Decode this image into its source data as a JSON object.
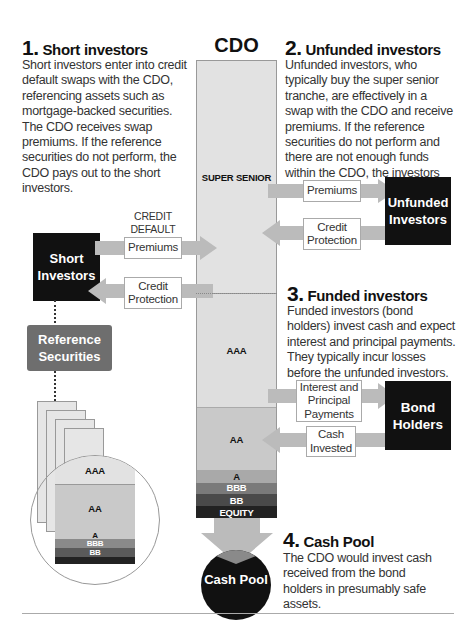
{
  "sections": {
    "short": {
      "number": "1.",
      "title": "Short investors",
      "body": "Short investors enter into credit default swaps with the CDO, referencing assets such as mortgage-backed securities. The CDO receives swap premiums. If the reference securities do not perform, the CDO pays out to the short investors."
    },
    "unfunded": {
      "number": "2.",
      "title": "Unfunded investors",
      "body": "Unfunded investors, who typically buy the super senior tranche, are effectively in a swap with the CDO and receive premiums. If the reference securities do not perform and there are not enough funds within the CDO, the investors pay."
    },
    "funded": {
      "number": "3.",
      "title": "Funded investors",
      "body": "Funded investors (bond holders) invest cash and expect interest and principal payments. They typically incur losses before the unfunded investors."
    },
    "cashpool": {
      "number": "4.",
      "title": "Cash Pool",
      "body": "The CDO would invest cash received from the bond holders in presumably safe assets."
    }
  },
  "cdo": {
    "title": "CDO",
    "tranches": [
      {
        "label": "SUPER SENIOR",
        "color": "#e2e2e2",
        "text": "#111"
      },
      {
        "label": "AAA",
        "color": "#dedede",
        "text": "#111"
      },
      {
        "label": "AA",
        "color": "#c9c9c9",
        "text": "#111"
      },
      {
        "label": "A",
        "color": "#a9a9a9",
        "text": "#111"
      },
      {
        "label": "BBB",
        "color": "#7a7a7a",
        "text": "#fff"
      },
      {
        "label": "BB",
        "color": "#4a4a4a",
        "text": "#fff"
      },
      {
        "label": "EQUITY",
        "color": "#222222",
        "text": "#fff"
      }
    ]
  },
  "entities": {
    "short_investors": "Short Investors",
    "unfunded_investors": "Unfunded Investors",
    "bond_holders": "Bond Holders",
    "reference_securities": "Reference Securities",
    "cash_pool": "Cash Pool"
  },
  "flows": {
    "cds_caption": "CREDIT DEFAULT SWAPS",
    "short_premiums": "Premiums",
    "short_protection": "Credit Protection",
    "unfunded_premiums": "Premiums",
    "unfunded_protection": "Credit Protection",
    "bond_interest": "Interest and Principal Payments",
    "bond_cash": "Cash Invested"
  },
  "reference_stack": {
    "tranches": [
      {
        "label": "AAA",
        "color": "#e2e2e2",
        "text": "#111"
      },
      {
        "label": "AA",
        "color": "#c9c9c9",
        "text": "#111"
      },
      {
        "label": "A",
        "color": "#c9c9c9",
        "text": "#111"
      },
      {
        "label": "BBB",
        "color": "#8a8a8a",
        "text": "#fff"
      },
      {
        "label": "BB",
        "color": "#5a5a5a",
        "text": "#fff"
      }
    ]
  },
  "colors": {
    "dark": "#111111",
    "reference_box": "#6e6e6e",
    "arrow": "#bbbbbb",
    "cash_arrow_tip": "#8a8a8a"
  }
}
